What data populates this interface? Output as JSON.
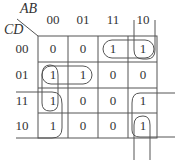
{
  "kmap": {
    "row_var": "CD",
    "col_var": "AB",
    "col_labels": [
      "00",
      "01",
      "11",
      "10"
    ],
    "row_labels": [
      "00",
      "01",
      "11",
      "10"
    ],
    "cells": [
      [
        "0",
        "0",
        "1",
        "1"
      ],
      [
        "1",
        "1",
        "0",
        "0"
      ],
      [
        "1",
        "0",
        "0",
        "1"
      ],
      [
        "1",
        "0",
        "0",
        "1"
      ]
    ],
    "groups": [
      {
        "name": "row00-cols11-10",
        "cells": [
          [
            0,
            2
          ],
          [
            0,
            3
          ]
        ]
      },
      {
        "name": "col10-wrap",
        "cells": [
          [
            0,
            3
          ],
          [
            3,
            3
          ]
        ]
      },
      {
        "name": "row01-cols00-01",
        "cells": [
          [
            1,
            0
          ],
          [
            1,
            1
          ]
        ]
      },
      {
        "name": "col00-rows01-11-10",
        "cells": [
          [
            1,
            0
          ],
          [
            2,
            0
          ],
          [
            3,
            0
          ]
        ]
      },
      {
        "name": "corner-wrap-10",
        "cells": [
          [
            2,
            3
          ],
          [
            3,
            3
          ]
        ]
      }
    ],
    "line_color": "#555555"
  }
}
